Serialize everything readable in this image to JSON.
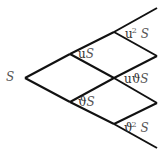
{
  "diagram": {
    "type": "binomial-tree",
    "steps": 2,
    "nodes": {
      "root": {
        "label": "S"
      },
      "up": {
        "coef": "u",
        "var": "S"
      },
      "down": {
        "coef": "ϑ",
        "var": "S"
      },
      "upup": {
        "coef": "u",
        "exp": "2",
        "var": "S"
      },
      "updown": {
        "coef": "uϑ",
        "var": "S"
      },
      "downdown": {
        "coef": "ϑ",
        "exp": "2",
        "var": "S"
      }
    },
    "line_color": "#111111"
  }
}
